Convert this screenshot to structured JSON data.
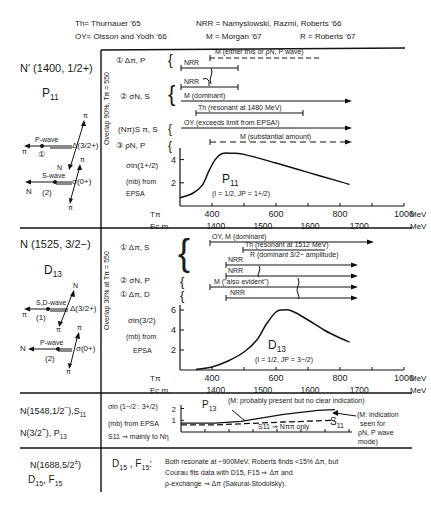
{
  "legend": {
    "th": "Th= Thurnauer '65",
    "oy": "OY= Olsson and Yodh '66",
    "nrr": "NRR = Namyslowski, Razmi, Roberts '66",
    "m": "M = Morgan '67",
    "r": "R = Roberts '67"
  },
  "rows": [
    {
      "state": "N' (1400, 1/2+)",
      "wave": "P11",
      "diagram": {
        "d1_label": "P-wave",
        "d1_num": "①",
        "d1_delta": "Δ(3/2+)",
        "d1_pi_left": "π",
        "d1_pi_top": "π",
        "d1_n": "N",
        "d2_label": "S-wave",
        "d2_num": "(2)",
        "d2_sigma": "σ(0+)",
        "d2_n": "N",
        "d2_pi_top": "π",
        "d2_pi_bot": "π"
      },
      "overlap": "Overlap 90%, Tπ = 550",
      "channels": [
        {
          "label": "① Δπ, P"
        },
        {
          "label": "② σN, S"
        },
        {
          "label": "(Nπ)S π, S"
        },
        {
          "label": "③ ρN, P"
        }
      ],
      "bars": [
        {
          "text": "M (either this or ρN, P wave)",
          "style": "dashed"
        },
        {
          "text": "NRR",
          "style": "solid"
        },
        {
          "text": "NRR",
          "style": "solid"
        },
        {
          "text": "M (dominant)",
          "style": "arrow"
        },
        {
          "text": "Th (resonant at 1480 MeV)",
          "style": "solid"
        },
        {
          "text": "OY (exceeds limit from EPSA!)",
          "style": "arrow"
        },
        {
          "text": "M (substantial amount)",
          "style": "dashed-arrow"
        }
      ],
      "ylabel_lines": [
        "σin(1+/2)",
        "(mb) from",
        "EPSA"
      ],
      "curve_label": "P11",
      "curve_qn": "(I = 1/2, JP = 1+/2)"
    },
    {
      "state": "N (1525, 3/2−)",
      "wave": "D13",
      "diagram": {
        "d1_label": "S,D-wave",
        "d1_num": "(1)",
        "d1_delta": "Δ(3/2+)",
        "d1_pi_left": "π",
        "d1_n": "N",
        "d1_pi_bot": "π",
        "d2_label": "P-wave",
        "d2_num": "(2)",
        "d2_sigma": "σ(0+)",
        "d2_n": "N",
        "d2_pi_top": "π",
        "d2_pi_bot": "π"
      },
      "overlap": "Overlap 30% at Tπ = 550",
      "channels": [
        {
          "label": "① Δπ, S"
        },
        {
          "label": "② σN, P"
        },
        {
          "label": "① Δπ, D"
        }
      ],
      "bars": [
        {
          "text": "OY, M    (dominant)",
          "style": "arrow"
        },
        {
          "text": "Th (resonant at 1512 MeV)",
          "style": "solid"
        },
        {
          "text": "R (dominant 3/2− amplitude)",
          "style": "text"
        },
        {
          "text": "NRR",
          "style": "arrow"
        },
        {
          "text": "NRR",
          "style": "arrow"
        },
        {
          "text": "M  (\"also evident\")",
          "style": "arrow"
        },
        {
          "text": "NRR",
          "style": "arrow"
        }
      ],
      "ylabel_lines": [
        "σin(3/2)",
        "(mb) from",
        "EPSA"
      ],
      "curve_label": "D13",
      "curve_qn": "(I = 1/2, JP = 3−/2)"
    },
    {
      "state_1": "N(1548, 1/2−), S11",
      "state_2": "N(3/2+), P13",
      "ylabel_lines": [
        "σin (1−/2 : 3+/2)",
        "(mb) from EPSA"
      ],
      "note_s11": "S11 ⇒ mainly to Nη",
      "note_top": "(M: probably present but no clear indication)",
      "note_right": [
        "(M: indication",
        "seen for",
        "ρN, P wave",
        "mode)"
      ],
      "p13_label": "P13",
      "s11_label": "S11",
      "s11_only": "S11 ⇒ Nππ only"
    },
    {
      "state_1": "N(1688, 5/2±)",
      "state_2": "D15, F15",
      "head": "D15 , F15 :",
      "text_lines": [
        "Both resonate at ~900MeV. Roberts finds <15% Δπ, but",
        "Courau fits data with D15, F15 ⇒ Δπ and",
        "ρ-exchange ⇒ Δπ (Sakurai-Stodolsky)."
      ]
    }
  ],
  "chart_data": [
    {
      "type": "line",
      "title": "P11",
      "subtitle": "(I = 1/2, JP = 1+/2)",
      "xlabel": "Tπ (MeV)",
      "x2label": "Ec.m. (MeV)",
      "ylabel": "σin(1+/2) (mb) from EPSA",
      "x_ticks": [
        400,
        600,
        800,
        1000
      ],
      "x_unit": "MeV",
      "x2_ticks": [
        1400,
        1500,
        1600,
        1700
      ],
      "x2_unit": "MeV",
      "y_ticks": [
        2,
        4
      ],
      "xlim": [
        300,
        1000
      ],
      "ylim": [
        0,
        5
      ],
      "x": [
        300,
        340,
        370,
        390,
        410,
        430,
        460,
        500,
        600,
        700,
        800,
        830
      ],
      "y": [
        0.7,
        1.1,
        1.8,
        3.0,
        4.0,
        4.5,
        4.55,
        4.45,
        3.7,
        2.9,
        2.1,
        1.85
      ]
    },
    {
      "type": "line",
      "title": "D13",
      "subtitle": "(I = 1/2, JP = 3−/2)",
      "xlabel": "Tπ (MeV)",
      "x2label": "Ec.m. (MeV)",
      "ylabel": "σin(3/2) (mb) from EPSA",
      "x_ticks": [
        400,
        600,
        800,
        1000
      ],
      "x_unit": "MeV",
      "x2_ticks": [
        1400,
        1500,
        1600,
        1700
      ],
      "x2_unit": "MeV",
      "y_ticks": [
        2,
        4,
        6
      ],
      "xlim": [
        300,
        1000
      ],
      "ylim": [
        0,
        6.5
      ],
      "x": [
        350,
        400,
        450,
        500,
        540,
        570,
        600,
        620,
        650,
        700,
        750,
        800,
        830
      ],
      "y": [
        0.05,
        0.3,
        0.9,
        1.8,
        3.0,
        4.6,
        5.8,
        6.0,
        5.9,
        5.0,
        4.0,
        3.2,
        2.8
      ]
    },
    {
      "type": "line",
      "title": "P13 / S11",
      "ylabel": "σin (1−/2 : 3+/2) (mb) from EPSA",
      "y_ticks": [
        1,
        2
      ],
      "ylim": [
        0,
        2.3
      ],
      "series": [
        {
          "name": "P13",
          "x": [
            0,
            0.2,
            0.35,
            0.6,
            0.8,
            0.9
          ],
          "y": [
            0.75,
            0.75,
            0.9,
            1.5,
            1.85,
            1.9
          ]
        },
        {
          "name": "S11",
          "x": [
            0,
            0.2,
            0.35,
            0.6,
            0.8,
            0.9
          ],
          "y": [
            0.6,
            0.6,
            0.7,
            0.85,
            0.95,
            1.0
          ],
          "style": "dashed"
        }
      ]
    }
  ]
}
